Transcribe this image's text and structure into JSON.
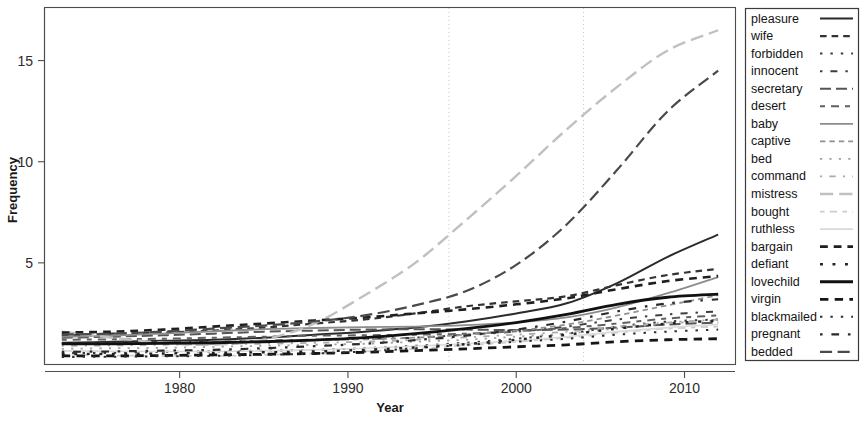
{
  "chart_data": {
    "type": "line",
    "title": "",
    "xlabel": "Year",
    "ylabel": "Frequency",
    "xlim": [
      1972,
      2013
    ],
    "ylim": [
      0,
      17.6
    ],
    "xticks": [
      1980,
      1990,
      2000,
      2010
    ],
    "xtick_labels": [
      "1980",
      "1990",
      "2000",
      "2010"
    ],
    "yticks": [
      5,
      10,
      15
    ],
    "ytick_labels": [
      "5",
      "10",
      "15"
    ],
    "grid": false,
    "legend_position": "right-outside",
    "reference_lines": {
      "vertical": [
        1996,
        2004
      ],
      "style": "dotted",
      "color": "#c9c9c9"
    },
    "x": [
      1973,
      1976,
      1979,
      1982,
      1985,
      1988,
      1991,
      1994,
      1997,
      2000,
      2003,
      2006,
      2009,
      2012
    ],
    "series": [
      {
        "name": "pleasure",
        "color": "#2b2b2b",
        "dash": "solid",
        "width": 2.0,
        "values": [
          1.05,
          1.1,
          1.15,
          1.2,
          1.3,
          1.45,
          1.6,
          1.8,
          2.1,
          2.5,
          3.0,
          4.0,
          5.3,
          6.4
        ]
      },
      {
        "name": "wife",
        "color": "#333333",
        "dash": "dash",
        "width": 2.2,
        "values": [
          1.4,
          1.5,
          1.55,
          1.65,
          1.8,
          2.0,
          2.2,
          2.5,
          2.85,
          3.1,
          3.35,
          3.9,
          4.4,
          4.7
        ]
      },
      {
        "name": "forbidden",
        "color": "#3a3a3a",
        "dash": "dot",
        "width": 2.0,
        "values": [
          0.55,
          0.55,
          0.6,
          0.62,
          0.66,
          0.7,
          0.78,
          0.9,
          1.05,
          1.25,
          1.5,
          1.85,
          2.1,
          2.2
        ]
      },
      {
        "name": "innocent",
        "color": "#3f3f3f",
        "dash": "dashdot",
        "width": 2.0,
        "values": [
          1.0,
          1.05,
          1.1,
          1.1,
          1.15,
          1.2,
          1.25,
          1.3,
          1.45,
          1.6,
          1.85,
          2.2,
          2.45,
          2.6
        ]
      },
      {
        "name": "secretary",
        "color": "#555555",
        "dash": "longdash",
        "width": 2.0,
        "values": [
          1.3,
          1.35,
          1.42,
          1.5,
          1.6,
          1.65,
          1.7,
          1.72,
          1.7,
          1.68,
          1.7,
          1.8,
          1.95,
          2.05
        ]
      },
      {
        "name": "desert",
        "color": "#606060",
        "dash": "twodash",
        "width": 2.0,
        "values": [
          1.2,
          1.22,
          1.25,
          1.3,
          1.35,
          1.4,
          1.42,
          1.45,
          1.5,
          1.62,
          1.78,
          2.0,
          2.25,
          2.4
        ]
      },
      {
        "name": "baby",
        "color": "#8c8c8c",
        "dash": "solid",
        "width": 1.8,
        "values": [
          1.35,
          1.4,
          1.5,
          1.62,
          1.72,
          1.78,
          1.82,
          1.85,
          1.92,
          2.05,
          2.3,
          2.8,
          3.5,
          4.3
        ]
      },
      {
        "name": "captive",
        "color": "#919191",
        "dash": "dash",
        "width": 1.8,
        "values": [
          1.0,
          1.02,
          1.05,
          1.1,
          1.14,
          1.18,
          1.22,
          1.3,
          1.45,
          1.65,
          1.95,
          2.4,
          2.9,
          3.4
        ]
      },
      {
        "name": "bed",
        "color": "#a0a0a0",
        "dash": "dot",
        "width": 1.8,
        "values": [
          0.75,
          0.78,
          0.8,
          0.85,
          0.9,
          0.95,
          1.0,
          1.1,
          1.2,
          1.35,
          1.5,
          1.75,
          2.0,
          2.15
        ]
      },
      {
        "name": "command",
        "color": "#aaaaaa",
        "dash": "dashdot",
        "width": 1.8,
        "values": [
          0.9,
          0.92,
          0.95,
          0.98,
          1.0,
          1.05,
          1.1,
          1.2,
          1.32,
          1.45,
          1.6,
          1.85,
          2.05,
          2.2
        ]
      },
      {
        "name": "mistress",
        "color": "#c0c0c0",
        "dash": "longdash",
        "width": 2.4,
        "values": [
          1.6,
          1.3,
          1.05,
          0.95,
          1.2,
          2.0,
          3.4,
          5.0,
          7.1,
          9.3,
          11.6,
          13.7,
          15.5,
          16.5
        ]
      },
      {
        "name": "bought",
        "color": "#cccccc",
        "dash": "twodash",
        "width": 1.8,
        "values": [
          0.45,
          0.42,
          0.4,
          0.4,
          0.45,
          0.52,
          0.62,
          0.75,
          0.92,
          1.1,
          1.3,
          1.55,
          1.75,
          1.85
        ]
      },
      {
        "name": "ruthless",
        "color": "#d9d9d9",
        "dash": "solid",
        "width": 1.6,
        "values": [
          0.65,
          0.63,
          0.62,
          0.62,
          0.65,
          0.7,
          0.78,
          0.88,
          1.0,
          1.15,
          1.35,
          1.6,
          1.8,
          1.95
        ]
      },
      {
        "name": "bargain",
        "color": "#1f1f1f",
        "dash": "dash",
        "width": 2.6,
        "values": [
          1.55,
          1.6,
          1.7,
          1.85,
          2.0,
          2.15,
          2.3,
          2.5,
          2.7,
          2.95,
          3.25,
          3.7,
          4.1,
          4.35
        ]
      },
      {
        "name": "defiant",
        "color": "#232323",
        "dash": "dot",
        "width": 2.4,
        "values": [
          0.5,
          0.5,
          0.52,
          0.55,
          0.58,
          0.62,
          0.7,
          0.82,
          0.98,
          1.2,
          1.45,
          1.75,
          2.0,
          2.15
        ]
      },
      {
        "name": "lovechild",
        "color": "#111111",
        "dash": "solid",
        "width": 2.8,
        "values": [
          1.0,
          1.0,
          1.02,
          1.05,
          1.1,
          1.18,
          1.3,
          1.5,
          1.75,
          2.05,
          2.45,
          2.95,
          3.3,
          3.45
        ]
      },
      {
        "name": "virgin",
        "color": "#161616",
        "dash": "dash",
        "width": 2.8,
        "values": [
          0.4,
          0.4,
          0.42,
          0.45,
          0.48,
          0.52,
          0.58,
          0.66,
          0.75,
          0.85,
          0.95,
          1.1,
          1.2,
          1.25
        ]
      },
      {
        "name": "blackmailed",
        "color": "#2e2e2e",
        "dash": "dot",
        "width": 2.0,
        "values": [
          0.35,
          0.36,
          0.38,
          0.4,
          0.45,
          0.52,
          0.62,
          0.78,
          0.95,
          1.1,
          1.25,
          1.45,
          1.6,
          1.7
        ]
      },
      {
        "name": "pregnant",
        "color": "#2a2a2a",
        "dash": "dashdot",
        "width": 2.2,
        "values": [
          0.6,
          0.62,
          0.66,
          0.7,
          0.78,
          0.88,
          1.0,
          1.18,
          1.4,
          1.7,
          2.1,
          2.6,
          3.0,
          3.2
        ]
      },
      {
        "name": "bedded",
        "color": "#4a4a4a",
        "dash": "longdash",
        "width": 2.2,
        "values": [
          1.45,
          1.5,
          1.6,
          1.75,
          1.9,
          2.1,
          2.4,
          2.9,
          3.6,
          4.9,
          6.9,
          9.6,
          12.5,
          14.5
        ]
      }
    ]
  },
  "axes": {
    "y_title": "Frequency",
    "x_title": "Year"
  },
  "legend": {
    "entries": [
      {
        "label": "pleasure"
      },
      {
        "label": "wife"
      },
      {
        "label": "forbidden"
      },
      {
        "label": "innocent"
      },
      {
        "label": "secretary"
      },
      {
        "label": "desert"
      },
      {
        "label": "baby"
      },
      {
        "label": "captive"
      },
      {
        "label": "bed"
      },
      {
        "label": "command"
      },
      {
        "label": "mistress"
      },
      {
        "label": "bought"
      },
      {
        "label": "ruthless"
      },
      {
        "label": "bargain"
      },
      {
        "label": "defiant"
      },
      {
        "label": "lovechild"
      },
      {
        "label": "virgin"
      },
      {
        "label": "blackmailed"
      },
      {
        "label": "pregnant"
      },
      {
        "label": "bedded"
      }
    ]
  }
}
